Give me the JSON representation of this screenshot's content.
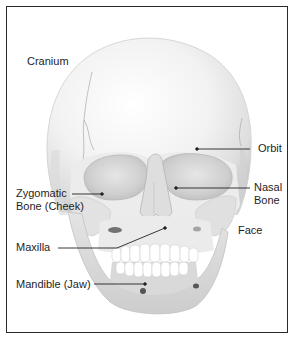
{
  "figure": {
    "labels": {
      "cranium": "Cranium",
      "orbit": "Orbit",
      "zygomatic_line1": "Zygomatic",
      "zygomatic_line2": "Bone (Cheek)",
      "nasal_line1": "Nasal",
      "nasal_line2": "Bone",
      "face": "Face",
      "maxilla": "Maxilla",
      "mandible": "Mandible (Jaw)"
    },
    "colors": {
      "border": "#2a2a2a",
      "text": "#1e1e1e",
      "leader_line": "#222222",
      "bone_light": "#f4f4f4",
      "bone_shade": "#d6d6d6",
      "bone_dark": "#9a9a9a"
    }
  }
}
